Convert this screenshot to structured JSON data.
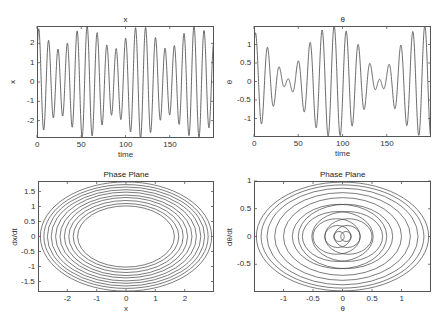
{
  "figure": {
    "width": 447,
    "height": 328,
    "line_color": "#444444",
    "axis_color": "#555555"
  },
  "chart_data": [
    {
      "id": "x_time",
      "type": "line",
      "title": "x",
      "xlabel": "time",
      "ylabel": "x",
      "xlim": [
        0,
        200
      ],
      "ylim": [
        -2.9,
        2.9
      ],
      "xticks": [
        0,
        50,
        100,
        150
      ],
      "xtick_labels": [
        "0",
        "50",
        "100",
        "150"
      ],
      "yticks": [
        -2,
        -1,
        0,
        1,
        2
      ],
      "ytick_labels": [
        "-2",
        "-1",
        "0",
        "1",
        "2"
      ],
      "box_px": [
        37,
        26,
        214,
        138
      ],
      "grid": false,
      "series": [
        {
          "name": "x(t)",
          "generator": {
            "kind": "beat",
            "a1": 2.3,
            "w1": 0.572,
            "a2": 0.6,
            "w2": 0.47,
            "p1": 0.6,
            "p2": 0.0
          },
          "peaks_approx": [
            1.8,
            2.35,
            2.9,
            2.75,
            2.2,
            1.75,
            2.2,
            2.7,
            2.9,
            2.4,
            1.85,
            2.05,
            2.85,
            2.5,
            1.9,
            1.9,
            2.5,
            2.9,
            2.7
          ],
          "samples": 1400
        }
      ]
    },
    {
      "id": "theta_time",
      "type": "line",
      "title": "θ",
      "xlabel": "time",
      "ylabel": "θ",
      "xlim": [
        0,
        200
      ],
      "ylim": [
        -1.5,
        1.5
      ],
      "xticks": [
        0,
        50,
        100,
        150
      ],
      "xtick_labels": [
        "0",
        "50",
        "100",
        "150"
      ],
      "yticks": [
        -1,
        -0.5,
        0,
        0.5,
        1
      ],
      "ytick_labels": [
        "-1",
        "-0.5",
        "0",
        "0.5",
        "1"
      ],
      "box_px": [
        254,
        26,
        431,
        137
      ],
      "grid": false,
      "series": [
        {
          "name": "θ(t)",
          "generator": {
            "kind": "beat",
            "a1": 0.78,
            "w1": 0.49,
            "a2": 0.72,
            "w2": 0.43,
            "p1": 1.2,
            "p2": 0.3
          },
          "peaks_approx": [
            1.5,
            1.15,
            0.5,
            0.05,
            0.7,
            1.25,
            1.5,
            1.2,
            0.7,
            0.5,
            1.1,
            1.5,
            1.1,
            0.3,
            0.3,
            1.0,
            1.45,
            1.5,
            0.5,
            0.1,
            0.8
          ],
          "samples": 1400
        }
      ]
    },
    {
      "id": "x_phase",
      "type": "line",
      "title": "Phase Plane",
      "xlabel": "x",
      "ylabel": "dx/dt",
      "xlim": [
        -3,
        3
      ],
      "ylim": [
        -1.85,
        1.85
      ],
      "xticks": [
        -2,
        -1,
        0,
        1,
        2
      ],
      "xtick_labels": [
        "-2",
        "-1",
        "0",
        "1",
        "2"
      ],
      "yticks": [
        -1.5,
        -1,
        -0.5,
        0,
        0.5,
        1,
        1.5
      ],
      "ytick_labels": [
        "-1.5",
        "-1",
        "-0.5",
        "0",
        "0.5",
        "1",
        "1.5"
      ],
      "box_px": [
        38,
        181,
        214,
        292
      ],
      "grid": false,
      "series": [
        {
          "name": "(x, dx/dt)",
          "description": "Nested elliptical orbits, inner radius ~1.6 in x / ~1.0 in dx/dt, outer ~2.95 / ~1.85",
          "rings": [
            [
              1.65,
              1.02
            ],
            [
              1.8,
              1.1
            ],
            [
              1.95,
              1.2
            ],
            [
              2.1,
              1.3
            ],
            [
              2.25,
              1.38
            ],
            [
              2.4,
              1.48
            ],
            [
              2.55,
              1.56
            ],
            [
              2.68,
              1.65
            ],
            [
              2.8,
              1.73
            ],
            [
              2.92,
              1.82
            ]
          ]
        }
      ]
    },
    {
      "id": "theta_phase",
      "type": "line",
      "title": "Phase Plane",
      "xlabel": "θ",
      "ylabel": "dθ/dt",
      "xlim": [
        -1.5,
        1.5
      ],
      "ylim": [
        -1,
        1
      ],
      "xticks": [
        -1,
        -0.5,
        0,
        0.5,
        1
      ],
      "xtick_labels": [
        "-1",
        "-0.5",
        "0",
        "0.5",
        "1"
      ],
      "yticks": [
        -0.5,
        0,
        0.5,
        1
      ],
      "ytick_labels": [
        "-0.5",
        "0",
        "0.5",
        "1"
      ],
      "box_px": [
        254,
        181,
        431,
        292
      ],
      "grid": false,
      "series": [
        {
          "name": "(θ, dθ/dt)",
          "description": "Off-centre circles nested down to small loops near the origin (radius ~0.08), out to outer ellipse ~1.45 × 0.98",
          "rings": [
            [
              0.09,
              0.09,
              -0.06
            ],
            [
              0.09,
              0.09,
              0.06
            ],
            [
              0.22,
              0.2,
              -0.08
            ],
            [
              0.22,
              0.2,
              0.08
            ],
            [
              0.4,
              0.32,
              -0.1
            ],
            [
              0.4,
              0.32,
              0.1
            ],
            [
              0.6,
              0.45,
              -0.08
            ],
            [
              0.6,
              0.45,
              0.08
            ],
            [
              0.8,
              0.58,
              -0.05
            ],
            [
              0.8,
              0.58,
              0.05
            ],
            [
              1.0,
              0.7,
              0.0
            ],
            [
              1.15,
              0.79,
              0.0
            ],
            [
              1.28,
              0.87,
              0.0
            ],
            [
              1.38,
              0.93,
              0.0
            ],
            [
              1.46,
              0.98,
              0.0
            ]
          ]
        }
      ]
    }
  ]
}
